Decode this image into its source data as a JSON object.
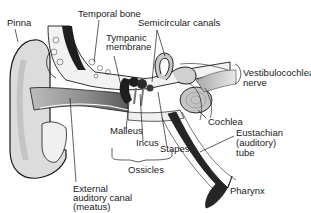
{
  "diagram": {
    "colors": {
      "background": "#ffffff",
      "skin": "#d9d9d9",
      "canal": "#8a8a8a",
      "dark_tube": "#2a2a2a",
      "inner_ear": "#bdbdbd",
      "outline": "#1a1a1a"
    },
    "labels": {
      "pinna": "Pinna",
      "temporal_bone": "Temporal bone",
      "semicircular_canals": "Semicircular canals",
      "tympanic_membrane_1": "Tympanic",
      "tympanic_membrane_2": "membrane",
      "vestibulocochlear_1": "Vestibulocochlear",
      "vestibulocochlear_2": "nerve",
      "cochlea": "Cochlea",
      "eustachian_1": "Eustachian",
      "eustachian_2": "(auditory)",
      "eustachian_3": "tube",
      "malleus": "Malleus",
      "incus": "Incus",
      "stapes": "Stapes",
      "ossicles": "Ossicles",
      "external_canal_1": "External",
      "external_canal_2": "auditory canal",
      "external_canal_3": "(meatus)",
      "pharynx": "Pharynx"
    }
  }
}
